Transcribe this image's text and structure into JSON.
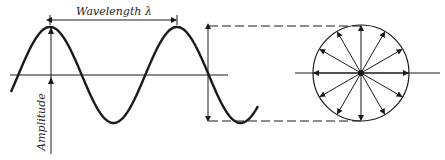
{
  "diagram": {
    "wavelength_label": "Wavelength λ",
    "amplitude_label": "Amplitude",
    "wave": {
      "type": "sine",
      "cycles_shown": 2,
      "description": "Sine wave with two crests; horizontal axis through zero"
    },
    "circle": {
      "spokes": 12,
      "description": "Circle with radial double-direction arrows from center, projected from wave amplitude via dashed lines"
    },
    "colors": {
      "ink": "#1a1a1a",
      "background": "#ffffff"
    }
  }
}
